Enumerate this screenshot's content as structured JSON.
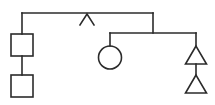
{
  "diagram": {
    "title": "",
    "stroke_color": "#2b2b2b",
    "background": "#ffffff",
    "nodes": [
      {
        "id": "root-caret",
        "shape": "caret",
        "label": ""
      },
      {
        "id": "square-1",
        "shape": "square",
        "label": ""
      },
      {
        "id": "square-2",
        "shape": "square",
        "label": ""
      },
      {
        "id": "circle-1",
        "shape": "circle",
        "label": ""
      },
      {
        "id": "triangle-1",
        "shape": "triangle",
        "label": ""
      },
      {
        "id": "triangle-2",
        "shape": "triangle",
        "label": ""
      }
    ],
    "edges": [
      {
        "from": "root-caret",
        "to": "square-1"
      },
      {
        "from": "square-1",
        "to": "square-2"
      },
      {
        "from": "root-caret",
        "to": "circle-1"
      },
      {
        "from": "root-caret",
        "to": "triangle-1"
      },
      {
        "from": "triangle-1",
        "to": "triangle-2"
      }
    ]
  }
}
